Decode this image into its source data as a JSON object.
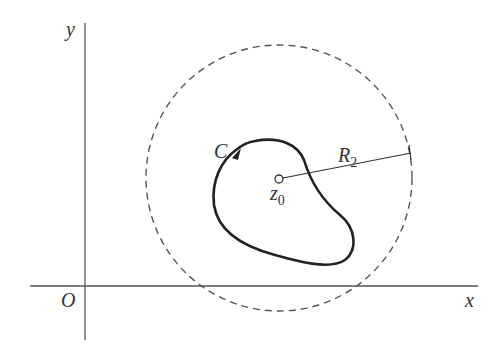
{
  "diagram": {
    "type": "complex-plane contour",
    "axes": {
      "x_label": "x",
      "y_label": "y",
      "origin_label": "O"
    },
    "contour": {
      "label": "C",
      "orientation": "counterclockwise",
      "style": "solid"
    },
    "center_point": {
      "label_main": "z",
      "label_sub": "0"
    },
    "circle": {
      "style": "dashed",
      "radius_label_main": "R",
      "radius_label_sub": "2"
    },
    "colors": {
      "stroke": "#333333",
      "axis": "#555555",
      "background": "#ffffff"
    }
  }
}
